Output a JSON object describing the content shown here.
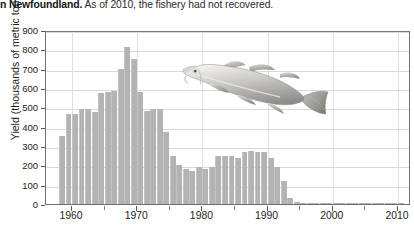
{
  "caption": {
    "lead": "n Newfoundland.",
    "rest": " As of 2010, the fishery had not recovered."
  },
  "illustration": {
    "name": "atlantic-cod-fish",
    "alt": "Atlantic cod"
  },
  "chart_data": {
    "type": "bar",
    "title": "",
    "xlabel": "",
    "ylabel": "Yield (thousands of metric tons)",
    "xlim": [
      1956,
      2012
    ],
    "ylim": [
      0,
      900
    ],
    "ytick_values": [
      0,
      100,
      200,
      300,
      400,
      500,
      600,
      700,
      800,
      900
    ],
    "ytick_labels": [
      "0",
      "100",
      "200",
      "300",
      "400",
      "500",
      "600",
      "700",
      "800",
      "900"
    ],
    "xtick_values": [
      1960,
      1970,
      1980,
      1990,
      2000,
      2010
    ],
    "xtick_labels": [
      "1960",
      "1970",
      "1980",
      "1990",
      "2000",
      "2010"
    ],
    "xtick_minor": [
      1965,
      1975,
      1985,
      1995,
      2005
    ],
    "grid": true,
    "legend": "none",
    "bar_color": "#b3b3b3",
    "units": "thousands of metric tons",
    "categories": [
      1958,
      1959,
      1960,
      1961,
      1962,
      1963,
      1964,
      1965,
      1966,
      1967,
      1968,
      1969,
      1970,
      1971,
      1972,
      1973,
      1974,
      1975,
      1976,
      1977,
      1978,
      1979,
      1980,
      1981,
      1982,
      1983,
      1984,
      1985,
      1986,
      1987,
      1988,
      1989,
      1990,
      1991,
      1992,
      1993,
      1994,
      1995,
      1996,
      1997,
      1998,
      1999,
      2000,
      2001,
      2002,
      2003,
      2004,
      2005,
      2006,
      2007,
      2008,
      2009,
      2010
    ],
    "values": [
      350,
      465,
      465,
      490,
      490,
      475,
      575,
      580,
      585,
      700,
      810,
      750,
      580,
      480,
      490,
      490,
      375,
      250,
      200,
      180,
      170,
      190,
      180,
      190,
      250,
      250,
      250,
      240,
      270,
      275,
      270,
      270,
      240,
      190,
      120,
      30,
      10,
      5,
      5,
      5,
      5,
      5,
      5,
      5,
      5,
      5,
      5,
      5,
      5,
      5,
      5,
      5,
      5
    ]
  }
}
